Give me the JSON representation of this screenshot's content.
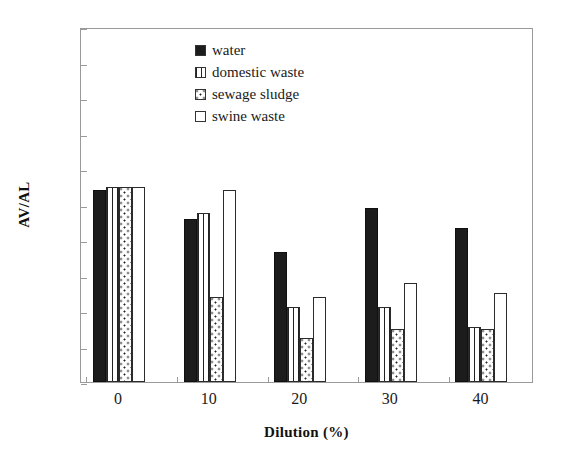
{
  "chart_data": {
    "type": "bar",
    "title": "",
    "subtitle": "",
    "xlabel": "Dilution (%)",
    "ylabel": "AV/AL",
    "categories": [
      "0",
      "10",
      "20",
      "30",
      "40"
    ],
    "series": [
      {
        "name": "water",
        "pattern": "solid",
        "values": [
          5.4,
          4.6,
          3.65,
          4.9,
          4.35
        ]
      },
      {
        "name": "domestic waste",
        "pattern": "vlines",
        "values": [
          5.5,
          4.75,
          2.1,
          2.1,
          1.55
        ]
      },
      {
        "name": "sewage sludge",
        "pattern": "dots",
        "values": [
          5.5,
          2.4,
          1.25,
          1.5,
          1.5
        ]
      },
      {
        "name": "swine waste",
        "pattern": "empty",
        "values": [
          5.5,
          5.4,
          2.4,
          2.8,
          2.5
        ]
      }
    ],
    "ylim": [
      0,
      10
    ],
    "yticks": [
      "0",
      "1",
      "2",
      "3",
      "4",
      "5",
      "6",
      "7",
      "8",
      "9",
      "10"
    ],
    "xticks": [
      "0",
      "10",
      "20",
      "30",
      "40"
    ],
    "grid": false,
    "legend_position": "upper-center",
    "colors": {
      "axis": "#9a9a9a",
      "text": "#1a1a1a",
      "bar_outline": "#2b2b2b",
      "fill_solid": "#1c1c1c",
      "background": "#ffffff"
    }
  },
  "legend": {
    "entries": [
      {
        "label": "water"
      },
      {
        "label": "domestic waste"
      },
      {
        "label": "sewage sludge"
      },
      {
        "label": "swine waste"
      }
    ]
  }
}
